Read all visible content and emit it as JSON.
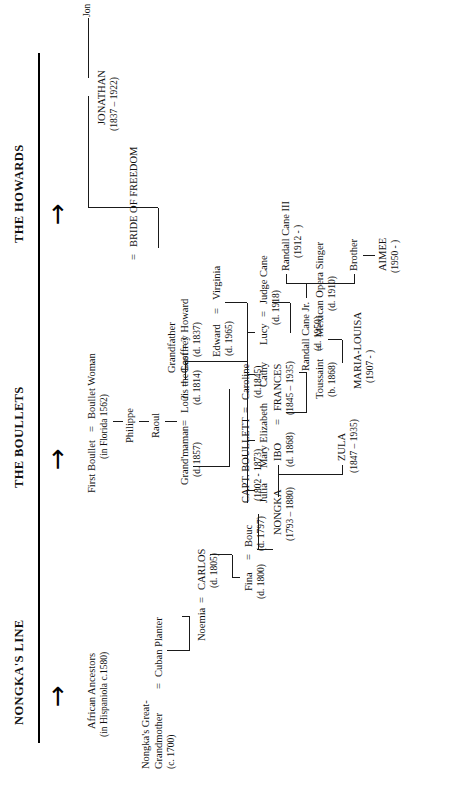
{
  "document": {
    "type": "family-tree-chart",
    "orientation": "landscape-rotated-90ccw"
  },
  "headers": [
    {
      "id": "nongkas-line",
      "label": "NONGKA'S LINE"
    },
    {
      "id": "the-boullets",
      "label": "THE BOULLETS"
    },
    {
      "id": "the-howards",
      "label": "THE HOWARDS"
    }
  ],
  "arrow_glyph": "→",
  "nongka": {
    "african_ancestors": "African Ancestors",
    "african_ancestors_note": "(in Hispaniola c.1580)",
    "great_grandmother_l1": "Nongka's Great-",
    "great_grandmother_l2": "Grandmother",
    "great_grandmother_date": "(c. 1700)",
    "eq1": "=",
    "cuban_planter": "Cuban Planter",
    "noemia": "Noemia",
    "eq2": "=",
    "carlos": "CARLOS",
    "carlos_date": "(d. 1805)",
    "fina": "Fina",
    "fina_date": "(d. 1800)",
    "eq3": "=",
    "bouc": "Bouc",
    "bouc_date": "(d. 1797)",
    "nongka_name": "NONGKA",
    "nongka_dates": "(1793 – 1880)",
    "zula": "ZULA",
    "zula_dates": "(1847 – 1935)",
    "ibo": "IBO",
    "ibo_date": "(d. 1868)",
    "eq4": "=",
    "frances": "FRANCES",
    "frances_dates": "(1845 – 1935)",
    "toussaint": "Toussaint",
    "toussaint_date": "(b. 1868)",
    "eq5": "=",
    "opera_singer": "Mexican Opera Singer",
    "opera_singer_date": "(d. 1910)",
    "maria_louisa": "MARIA-LOUISA",
    "maria_louisa_dates": "(1907 -  )"
  },
  "boullets": {
    "first_boullet": "First Boullet",
    "eq1": "=",
    "boullet_woman": "Boullet Woman",
    "florida": "(in Florida 1562)",
    "philippe": "Philippe",
    "raoul": "Raoul",
    "grandmaman": "Grand'maman",
    "grandmaman_date": "(d. 1857)",
    "eq2": "=",
    "louis_the_last": "Louis the Last = ?",
    "louis_date": "(d. 1814)",
    "capt_boullett": "CAPT. BOULLETT",
    "capt_dates": "(1802  -  1873)",
    "eq3": "=",
    "caroline": "Caroline",
    "caroline_date": "(d.1845)",
    "question": "?",
    "eq4": "=",
    "geoffrey_howard_l1": "Grandfather",
    "geoffrey_howard_l2": "Geoffrey Howard",
    "geoffrey_howard_date": "(d. 1837)",
    "edward": "Edward",
    "edward_date": "(d. 1965)",
    "eq5": "=",
    "virginia": "Virginia",
    "julia": "Julia",
    "mary_elizabeth": "Mary Elizabeth",
    "cathy": "Cathy",
    "lucy": "Lucy",
    "eq6": "=",
    "judge_cane": "Judge Cane",
    "judge_cane_date": "(d. 1918)",
    "randall_cane_jr": "Randall Cane Jr.",
    "randall_cane_jr_date": "(d. 1950)",
    "randall_cane_iii": "Randall Cane III",
    "randall_cane_iii_date": "(1912 -  )",
    "brother": "Brother",
    "aimee": "AIMEE",
    "aimee_date": "(1950 -  )"
  },
  "howards": {
    "eq1": "=",
    "bride_of_freedom": "BRIDE OF FREEDOM",
    "jonathan": "JONATHAN",
    "jonathan_dates": "(1837 – 1922)",
    "jon": "Jon"
  }
}
